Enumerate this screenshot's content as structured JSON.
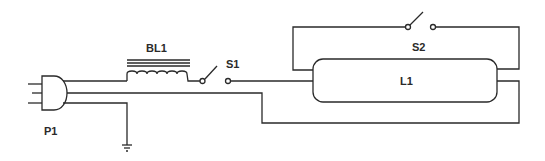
{
  "diagram": {
    "title": "",
    "type": "schematic",
    "components": [
      {
        "id": "P1",
        "label": "P1",
        "kind": "three-prong plug"
      },
      {
        "id": "BL1",
        "label": "BL1",
        "kind": "ballast inductor (iron core)"
      },
      {
        "id": "S1",
        "label": "S1",
        "kind": "SPST switch"
      },
      {
        "id": "S2",
        "label": "S2",
        "kind": "SPST switch (starter)"
      },
      {
        "id": "L1",
        "label": "L1",
        "kind": "fluorescent tube lamp"
      },
      {
        "id": "GND",
        "label": "",
        "kind": "ground"
      }
    ],
    "connections": [
      "P1 hot -> BL1 -> S1 -> L1 left upper pin",
      "L1 left lower pin / S2 loop -> L1 right upper pin via S2",
      "P1 neutral -> L1 right lower pin",
      "P1 ground -> earth ground"
    ],
    "colors": {
      "ink": "#2a2a2a",
      "background": "#ffffff"
    }
  }
}
